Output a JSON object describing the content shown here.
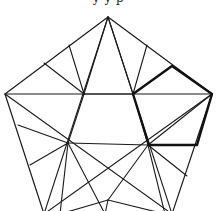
{
  "figure": {
    "caption_fragment": "y y p",
    "colors": {
      "line": "#1a1a1a",
      "bold": "#111111",
      "background": "#ffffff"
    },
    "outer_pentagon": [
      [
        108,
        17
      ],
      [
        5,
        94
      ],
      [
        44,
        214
      ],
      [
        172,
        214
      ],
      [
        212,
        94
      ]
    ],
    "bold_pentagon": [
      [
        133,
        94
      ],
      [
        172,
        66
      ],
      [
        212,
        94
      ],
      [
        197,
        145
      ],
      [
        149,
        145
      ]
    ],
    "segments": [
      [
        [
          5,
          94
        ],
        [
          212,
          94
        ]
      ],
      [
        [
          108,
          17
        ],
        [
          44,
          214
        ]
      ],
      [
        [
          108,
          17
        ],
        [
          172,
          214
        ]
      ],
      [
        [
          5,
          94
        ],
        [
          172,
          214
        ]
      ],
      [
        [
          212,
          94
        ],
        [
          44,
          214
        ]
      ],
      [
        [
          108,
          17
        ],
        [
          133,
          94
        ]
      ],
      [
        [
          108,
          17
        ],
        [
          84,
          94
        ]
      ],
      [
        [
          69,
          45
        ],
        [
          84,
          94
        ]
      ],
      [
        [
          44,
          63
        ],
        [
          84,
          94
        ]
      ],
      [
        [
          147,
          45
        ],
        [
          133,
          94
        ]
      ],
      [
        [
          84,
          94
        ],
        [
          68,
          143
        ]
      ],
      [
        [
          84,
          94
        ],
        [
          133,
          94
        ]
      ],
      [
        [
          18,
          125
        ],
        [
          68,
          143
        ]
      ],
      [
        [
          68,
          143
        ],
        [
          148,
          145
        ]
      ],
      [
        [
          68,
          143
        ],
        [
          30,
          165
        ]
      ],
      [
        [
          68,
          143
        ],
        [
          105,
          214
        ]
      ],
      [
        [
          68,
          143
        ],
        [
          60,
          214
        ]
      ],
      [
        [
          133,
          94
        ],
        [
          148,
          145
        ]
      ],
      [
        [
          148,
          145
        ],
        [
          108,
          200
        ]
      ],
      [
        [
          148,
          145
        ],
        [
          187,
          176
        ]
      ],
      [
        [
          148,
          145
        ],
        [
          165,
          214
        ]
      ],
      [
        [
          108,
          200
        ],
        [
          60,
          214
        ]
      ],
      [
        [
          108,
          200
        ],
        [
          165,
          214
        ]
      ],
      [
        [
          108,
          200
        ],
        [
          105,
          214
        ]
      ],
      [
        [
          212,
          94
        ],
        [
          148,
          145
        ]
      ]
    ]
  }
}
